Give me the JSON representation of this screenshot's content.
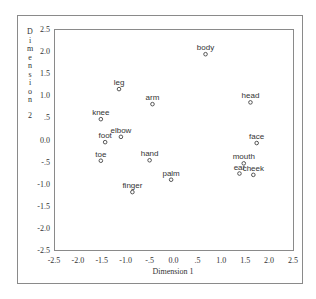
{
  "chart_data": {
    "type": "scatter",
    "title": "",
    "xlabel": "Dimension 1",
    "ylabel": "Dimension 2",
    "xlim": [
      -2.5,
      2.5
    ],
    "ylim": [
      -2.5,
      2.5
    ],
    "grid": false,
    "legend": "none",
    "xticks": [
      -2.5,
      -2.0,
      -1.5,
      -1.0,
      -0.5,
      0.0,
      0.5,
      1.0,
      1.5,
      2.0,
      2.5
    ],
    "xtick_labels": [
      "-2.5",
      "-2.0",
      "-1.5",
      "-1.0",
      "-.5",
      "0.0",
      ".5",
      "1.0",
      "1.5",
      "2.0",
      "2.5"
    ],
    "yticks": [
      2.5,
      2.0,
      1.5,
      1.0,
      0.5,
      0.0,
      -0.5,
      -1.0,
      -1.5,
      -2.0,
      -2.5
    ],
    "ytick_labels": [
      "2.5",
      "2.0",
      "1.5",
      "1.0",
      ".5",
      "0.0",
      "-.5",
      "-1.0",
      "-1.5",
      "-2.0",
      "-2.5"
    ],
    "points": [
      {
        "label": "body",
        "x": 0.67,
        "y": 1.93
      },
      {
        "label": "leg",
        "x": -1.14,
        "y": 1.14
      },
      {
        "label": "arm",
        "x": -0.44,
        "y": 0.8
      },
      {
        "label": "head",
        "x": 1.61,
        "y": 0.84
      },
      {
        "label": "knee",
        "x": -1.52,
        "y": 0.46
      },
      {
        "label": "elbow",
        "x": -1.1,
        "y": 0.06
      },
      {
        "label": "foot",
        "x": -1.43,
        "y": -0.06
      },
      {
        "label": "face",
        "x": 1.74,
        "y": -0.08
      },
      {
        "label": "toe",
        "x": -1.52,
        "y": -0.48
      },
      {
        "label": "hand",
        "x": -0.5,
        "y": -0.47
      },
      {
        "label": "mouth",
        "x": 1.47,
        "y": -0.54
      },
      {
        "label": "ear",
        "x": 1.38,
        "y": -0.77
      },
      {
        "label": "cheek",
        "x": 1.67,
        "y": -0.8
      },
      {
        "label": "palm",
        "x": -0.05,
        "y": -0.91
      },
      {
        "label": "finger",
        "x": -0.86,
        "y": -1.19
      }
    ]
  },
  "colors": {
    "frame": "#8a8a8a",
    "marker": "#444444",
    "text": "#333333"
  }
}
